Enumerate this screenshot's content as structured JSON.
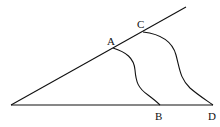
{
  "diagram": {
    "type": "geometry",
    "points": {
      "A": {
        "label": "A",
        "x": 113,
        "y": 48
      },
      "B": {
        "label": "B",
        "x": 160,
        "y": 105
      },
      "C": {
        "label": "C",
        "x": 143,
        "y": 32
      },
      "D": {
        "label": "D",
        "x": 213,
        "y": 105
      },
      "O": {
        "label": "",
        "x": 11,
        "y": 105
      }
    },
    "labels": {
      "A": "A",
      "B": "B",
      "C": "C",
      "D": "D"
    },
    "segments": [
      {
        "name": "base-line",
        "from": "O",
        "to": "D"
      },
      {
        "name": "upper-ray",
        "from": "O",
        "to_xy": [
          186,
          7
        ]
      }
    ],
    "curves": [
      {
        "name": "curve-AB",
        "from": "A",
        "to": "B"
      },
      {
        "name": "curve-CD",
        "from": "C",
        "to": "D"
      }
    ],
    "colors": {
      "stroke": "#111111",
      "background": "#ffffff"
    }
  }
}
